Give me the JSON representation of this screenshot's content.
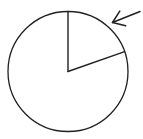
{
  "figure": {
    "title": "Circle with a marked sector",
    "background_color": "#ffffff",
    "stroke_color": "#231f20",
    "canvas": {
      "width": 143,
      "height": 139
    }
  },
  "chart_data": {
    "type": "pie",
    "title": "Circle with a marked sector",
    "subtitle": "",
    "xlabel": "",
    "ylabel": "",
    "grid": false,
    "legend_position": "none",
    "center": {
      "x": 68,
      "y": 71.5
    },
    "radius": 60,
    "units": "degrees",
    "total_degrees": 360,
    "categories": [
      "marked sector",
      "remaining region"
    ],
    "values": [
      70.7,
      289.3
    ],
    "fractions": [
      0.196,
      0.804
    ],
    "colors": [
      "#ffffff",
      "#ffffff"
    ],
    "slice_outline_color": "#231f20",
    "slices": [
      {
        "name": "marked sector",
        "start_angle_deg": 19.3,
        "end_angle_deg": 90.0,
        "sweep_deg": 70.7,
        "fraction": 0.196,
        "filled": false,
        "annotated": true
      },
      {
        "name": "remaining region",
        "start_angle_deg": 90.0,
        "end_angle_deg": 379.3,
        "sweep_deg": 289.3,
        "fraction": 0.804,
        "filled": false,
        "annotated": false
      }
    ],
    "radii_lines": [
      {
        "name": "vertical-radius",
        "angle_deg": 90.0,
        "from": {
          "x": 68,
          "y": 71.5
        },
        "to": {
          "x": 68,
          "y": 11
        }
      },
      {
        "name": "slanted-radius",
        "angle_deg": 19.3,
        "from": {
          "x": 68,
          "y": 71.5
        },
        "to": {
          "x": 125,
          "y": 51.7
        }
      }
    ],
    "annotations": [
      {
        "name": "sector-pointer-arrow",
        "kind": "arrow",
        "label": "",
        "tail": {
          "x": 140,
          "y": 11.5
        },
        "tip": {
          "x": 112.5,
          "y": 22.5
        },
        "direction": "down-left",
        "points_at": "marked sector arc"
      }
    ],
    "axis_ranges": {
      "x": [
        0,
        143
      ],
      "y": [
        0,
        139
      ]
    },
    "tick_labels": {
      "x": [],
      "y": []
    },
    "data_labels": []
  }
}
